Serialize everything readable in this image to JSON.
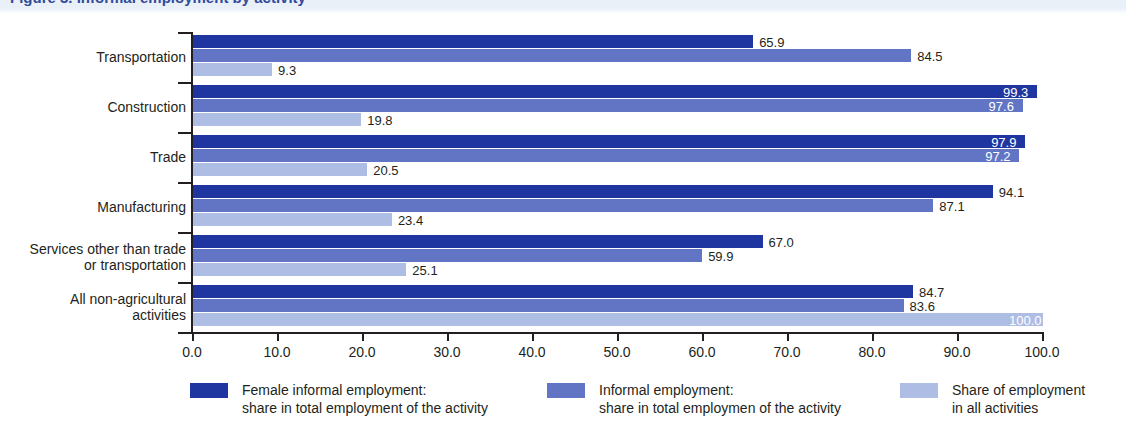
{
  "title_band": {
    "partial_title": "Figure 3.  Informal employment by activity"
  },
  "chart_data": {
    "type": "bar",
    "orientation": "horizontal",
    "title": "",
    "xlabel": "",
    "ylabel": "",
    "xlim": [
      0.0,
      100.0
    ],
    "grid": false,
    "legend_position": "bottom",
    "xticks": [
      "0.0",
      "10.0",
      "20.0",
      "30.0",
      "40.0",
      "50.0",
      "60.0",
      "70.0",
      "80.0",
      "90.0",
      "100.0"
    ],
    "xtick_values": [
      0,
      10,
      20,
      30,
      40,
      50,
      60,
      70,
      80,
      90,
      100
    ],
    "categories": [
      "Transportation",
      "Construction",
      "Trade",
      "Manufacturing",
      "Services other than trade\nor transportation",
      "All non-agricultural\nactivities"
    ],
    "category_lines": [
      [
        "Transportation"
      ],
      [
        "Construction"
      ],
      [
        "Trade"
      ],
      [
        "Manufacturing"
      ],
      [
        "Services other than trade",
        "or transportation"
      ],
      [
        "All non-agricultural",
        "activities"
      ]
    ],
    "series": [
      {
        "name": "Female informal employment: share in total employment of the activity",
        "color": "#1f36a0",
        "values": [
          65.9,
          99.3,
          97.9,
          94.1,
          67.0,
          84.7
        ],
        "labels": [
          "65.9",
          "99.3",
          "97.9",
          "94.1",
          "67.0",
          "84.7"
        ],
        "label_inside": [
          false,
          true,
          true,
          false,
          false,
          false
        ]
      },
      {
        "name": "Informal employment: share in total employmen of the activity",
        "color": "#6175c4",
        "values": [
          84.5,
          97.6,
          97.2,
          87.1,
          59.9,
          83.6
        ],
        "labels": [
          "84.5",
          "97.6",
          "97.2",
          "87.1",
          "59.9",
          "83.6"
        ],
        "label_inside": [
          false,
          true,
          true,
          false,
          false,
          false
        ]
      },
      {
        "name": "Share of employment in all activities",
        "color": "#aebde4",
        "values": [
          9.3,
          19.8,
          20.5,
          23.4,
          25.1,
          100.0
        ],
        "labels": [
          "9.3",
          "19.8",
          "20.5",
          "23.4",
          "25.1",
          "100.0"
        ],
        "label_inside": [
          false,
          false,
          false,
          false,
          false,
          true
        ]
      }
    ]
  },
  "legend": [
    {
      "color": "#1f36a0",
      "line1": "Female informal employment:",
      "line2": "share in total employment of the activity"
    },
    {
      "color": "#6175c4",
      "line1": "Informal employment:",
      "line2": "share in total employmen of the activity"
    },
    {
      "color": "#aebde4",
      "line1": "Share of employment",
      "line2": "in all activities"
    }
  ]
}
